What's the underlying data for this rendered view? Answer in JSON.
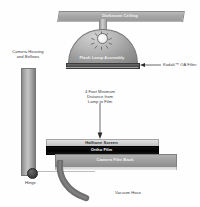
{
  "diagram": {
    "background_color": "#ffffff",
    "width": 200,
    "height": 207
  },
  "labels": {
    "ceiling": "Darkroom Ceiling",
    "lamp_assembly": "Flash Lamp Assembly",
    "filter": "Kodak™ OA Filter",
    "camera_housing": "Camera Housing\nand Bellows",
    "camera_housing_line1": "Camera Housing",
    "camera_housing_line2": "and Bellows",
    "distance_line1": "4 Foot Minimum",
    "distance_line2": "Distance from",
    "distance_line3": "Lamp to Film",
    "halftone_screen": "Halftone Screen",
    "ortho_film": "Ortho Film",
    "camera_film_back": "Camera Film Back",
    "hinge": "Hinge",
    "vacuum_hose": "Vacuum Hose"
  },
  "colors": {
    "ceiling_slab": "#a6a6a6",
    "dome": "#979797",
    "bulb": "#ffffff",
    "oa_filter": "#4a4a4a",
    "housing": "#b6b6b6",
    "halftone_screen": "#cfcfcf",
    "ortho_film": "#000000",
    "camera_film_back": "#9c9c9c",
    "hinge": "#3a3a3a",
    "vacuum_hose": "#6f6f6f",
    "label_text": "#3a3a3a",
    "arrow": "#2b2b2b"
  },
  "icons": {
    "light_rays": "light-rays-icon",
    "down_arrow": "down-arrow-icon",
    "left_arrow": "left-arrow-icon"
  }
}
